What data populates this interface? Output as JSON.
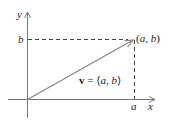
{
  "diagram": {
    "axes": {
      "x_label": "x",
      "y_label": "y"
    },
    "ticks": {
      "x_tick_label": "a",
      "y_tick_label": "b"
    },
    "point": {
      "label_open": "(",
      "label_a": "a",
      "label_sep": ", ",
      "label_b": "b",
      "label_close": ")"
    },
    "vector": {
      "name": "v",
      "equals": " = ",
      "open": "⟨",
      "comp_a": "a",
      "sep": ", ",
      "comp_b": "b",
      "close": "⟩"
    },
    "colors": {
      "axis": "#777777",
      "vector": "#888888",
      "dashed": "#444444",
      "text": "#222222"
    }
  }
}
